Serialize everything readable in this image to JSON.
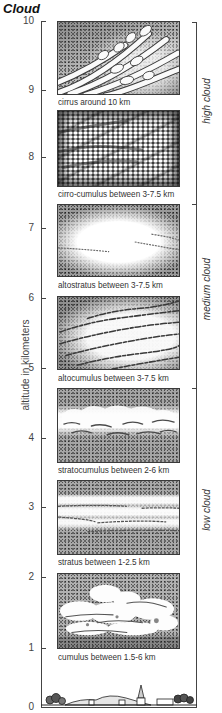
{
  "title": "Cloud",
  "axis": {
    "label": "altitude in kilometers",
    "unit": "km",
    "ticks": [
      {
        "label": "10"
      },
      {
        "label": "9"
      },
      {
        "label": "8"
      },
      {
        "label": "7"
      },
      {
        "label": "6"
      },
      {
        "label": "5"
      },
      {
        "label": "4"
      },
      {
        "label": "3"
      },
      {
        "label": "2"
      },
      {
        "label": "1"
      },
      {
        "label": "0"
      }
    ]
  },
  "groups": [
    {
      "label": "high cloud"
    },
    {
      "label": "medium cloud"
    },
    {
      "label": "low cloud"
    }
  ],
  "clouds": [
    {
      "caption": "cirrus around 10 km"
    },
    {
      "caption": "cirro-cumulus between 3-7.5 km"
    },
    {
      "caption": "altostratus between 3-7.5 km"
    },
    {
      "caption": "altocumulus between 3-7.5 km"
    },
    {
      "caption": "stratocumulus between 2-6 km"
    },
    {
      "caption": "stratus between 1-2.5 km"
    },
    {
      "caption": "cumulus between 1.5-6 km"
    }
  ]
}
